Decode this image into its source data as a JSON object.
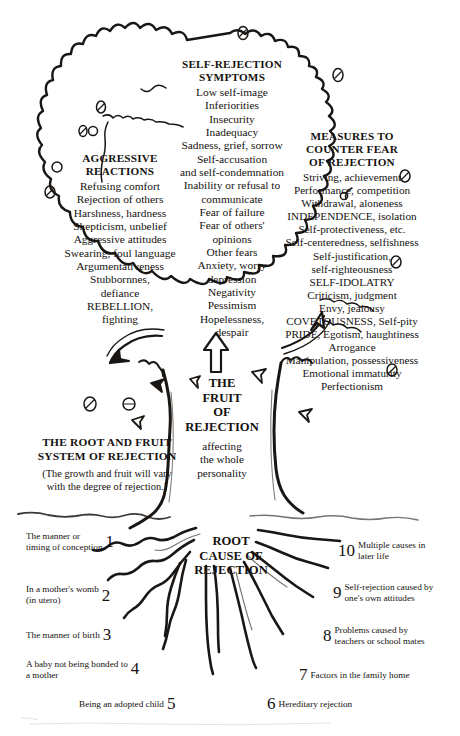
{
  "diagram": {
    "canopy": {
      "center": {
        "heading": "SELF-REJECTION\nSYMPTOMS",
        "items": [
          "Low self-image",
          "Inferiorities",
          "Insecurity",
          "Inadequacy",
          "Sadness, grief, sorrow",
          "Self-accusation\nand self-condemnation",
          "Inability or refusal to\ncommunicate",
          "Fear of failure",
          "Fear of others'\nopinions",
          "Other fears",
          "Anxiety, worry\ndepression",
          "Negativity",
          "Pessimism",
          "Hopelessness,\ndespair"
        ]
      },
      "left": {
        "heading": "AGGRESSIVE\nREACTIONS",
        "items": [
          "Refusing comfort",
          "Rejection of others",
          "Harshness, hardness",
          "Skepticism, unbelief",
          "Aggressive attitudes",
          "Swearing, foul language",
          "Argumentativeness",
          "Stubbornnes,\ndefiance",
          "REBELLION,\nfighting"
        ]
      },
      "right": {
        "heading": "MEASURES TO\nCOUNTER FEAR\nOF REJECTION",
        "items": [
          "Striving, achievement",
          "Performance, competition",
          "Withdrawal, aloneness",
          "INDEPENDENCE, isolation",
          "Self-protectiveness, etc.",
          "Self-centeredness, selfishness",
          "Self-justification,\nself-righteousness",
          "SELF-IDOLATRY",
          "Criticism, judgment",
          "Envy, jealousy",
          "COVETOUSNESS, Self-pity",
          "PRIDE, Egotism, haughtiness",
          "Arrogance",
          "Manipulation, possessiveness",
          "Emotional immaturity",
          "Perfectionism"
        ]
      }
    },
    "trunk": {
      "fruit_label": "THE\nFRUIT\nOF\nREJECTION",
      "affecting": "affecting\nthe whole\npersonality",
      "system_heading": "THE ROOT AND FRUIT\nSYSTEM OF REJECTION",
      "system_note": "(The growth and fruit will vary\nwith the degree of rejection.)"
    },
    "root": {
      "heading": "ROOT\nCAUSE OF\nREJECTION",
      "items": [
        {
          "number": "1",
          "label": "The manner or\ntiming of conception"
        },
        {
          "number": "2",
          "label": "In a mother's womb\n(in utero)"
        },
        {
          "number": "3",
          "label": "The manner of birth"
        },
        {
          "number": "4",
          "label": "A baby not being bonded to\na mother"
        },
        {
          "number": "5",
          "label": "Being an adopted child"
        },
        {
          "number": "6",
          "label": "Hereditary rejection"
        },
        {
          "number": "7",
          "label": "Factors in the family home"
        },
        {
          "number": "8",
          "label": "Problems caused by\nteachers or school mates"
        },
        {
          "number": "9",
          "label": "Self-rejection caused by\none's own attitudes"
        },
        {
          "number": "10",
          "label": "Multiple causes in\nlater life"
        }
      ]
    },
    "colors": {
      "ink": "#15120f",
      "paper": "#ffffff",
      "line": "#1a1613"
    }
  }
}
